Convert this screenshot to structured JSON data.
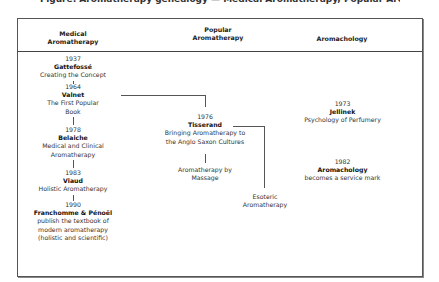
{
  "title_cut": "Figure: Aromatherapy genealogy — Medical Aromatherapy, Popular Aromatherapy and Aromachology",
  "columns": [
    {
      "label_line1": "Medical",
      "label_line2": "Aromatherapy"
    },
    {
      "label_line1": "Popular",
      "label_line2": "Aromatherapy"
    },
    {
      "label_line1": "Aromachology",
      "label_line2": ""
    }
  ],
  "medical": [
    {
      "year": "1937",
      "name": "Gattefossé",
      "desc": [
        "Creating the Concept"
      ]
    },
    {
      "year": "1964",
      "name": "Valnet",
      "desc": [
        "The First Popular",
        "Book"
      ]
    },
    {
      "year": "1978",
      "name": "Belaiche",
      "desc": [
        "Medical and Clinical",
        "Aromatherapy"
      ]
    },
    {
      "year": "1983",
      "name": "Viaud",
      "desc": [
        "Holistic Aromatherapy"
      ]
    },
    {
      "year": "1990",
      "name": "Franchomme & Pénoël",
      "desc": [
        "publish the textbook of",
        "modern aromatherapy",
        "(holistic and scientific)"
      ]
    }
  ],
  "popular": [
    {
      "year": "1976",
      "name": "Tisserand",
      "desc": [
        "Bringing Aromatherapy to",
        "the Anglo Saxon Cultures"
      ]
    },
    {
      "year": "",
      "name": "",
      "desc": [
        "Aromatherapy by",
        "Massage"
      ]
    },
    {
      "year": "",
      "name": "",
      "desc": [
        "Esoteric",
        "Aromatherapy"
      ]
    }
  ],
  "aromachology": [
    {
      "year": "1973",
      "name": "Jellinek",
      "desc": [
        "Psychology of Perfumery"
      ]
    },
    {
      "year": "1982",
      "name": "Aromachology",
      "desc": [
        "becomes a service mark"
      ]
    }
  ],
  "colors": {
    "line": "#555555",
    "frame": "#555555",
    "text": "#333333"
  }
}
